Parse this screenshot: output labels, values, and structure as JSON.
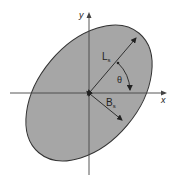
{
  "diagram": {
    "type": "ellipse-footprint",
    "axes": {
      "x_label": "x",
      "y_label": "y"
    },
    "ellipse": {
      "fill": "#a6a6a6",
      "stroke": "#333333",
      "rotation_deg": -50
    },
    "labels": {
      "length_main": "L",
      "length_sub": "s",
      "breadth_main": "B",
      "breadth_sub": "s",
      "angle": "θ"
    },
    "colors": {
      "axis": "#444444",
      "line": "#222222",
      "background": "#ffffff"
    }
  }
}
